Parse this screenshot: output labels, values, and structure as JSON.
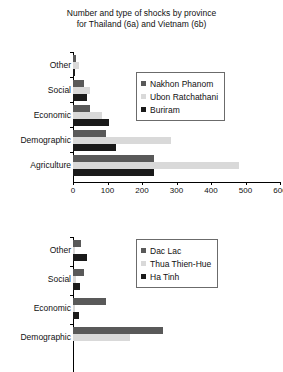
{
  "title": {
    "line1": "Number and type of shocks by province",
    "line2": "for Thailand (6a) and Vietnam (6b)"
  },
  "chart_data": [
    {
      "type": "bar",
      "orientation": "horizontal",
      "panel": "6a",
      "title": "Number and type of shocks by province for Thailand (6a)",
      "xlabel": "",
      "ylabel": "",
      "xlim": [
        0,
        600
      ],
      "xticks": [
        0,
        100,
        200,
        300,
        400,
        500,
        600
      ],
      "grid": false,
      "legend_position": "upper right",
      "categories": [
        "Other",
        "Social",
        "Economic",
        "Demographic",
        "Agriculture"
      ],
      "series": [
        {
          "name": "Nakhon Phanom",
          "color": "#595959",
          "values": [
            8,
            32,
            50,
            95,
            235
          ]
        },
        {
          "name": "Ubon Ratchathani",
          "color": "#d9d9d9",
          "values": [
            18,
            48,
            85,
            285,
            480
          ]
        },
        {
          "name": "Buriram",
          "color": "#1a1a1a",
          "values": [
            5,
            40,
            105,
            125,
            235
          ]
        }
      ]
    },
    {
      "type": "bar",
      "orientation": "horizontal",
      "panel": "6b",
      "title": "Number and type of shocks by province for Vietnam (6b)",
      "xlabel": "",
      "ylabel": "",
      "xlim": [
        0,
        600
      ],
      "xticks": [],
      "grid": false,
      "legend_position": "upper right",
      "note": "panel cropped at bottom of image; x-axis not visible",
      "categories": [
        "Other",
        "Social",
        "Economic",
        "Demographic"
      ],
      "series": [
        {
          "name": "Dac Lac",
          "color": "#595959",
          "values": [
            22,
            32,
            95,
            260
          ]
        },
        {
          "name": "Thua Thien-Hue",
          "color": "#d9d9d9",
          "values": [
            6,
            10,
            5,
            165
          ]
        },
        {
          "name": "Ha Tinh",
          "color": "#1a1a1a",
          "values": [
            42,
            20,
            18,
            0
          ]
        }
      ]
    }
  ],
  "chart_a": {
    "legend": [
      {
        "label": "Nakhon Phanom"
      },
      {
        "label": "Ubon Ratchathani"
      },
      {
        "label": "Buriram"
      }
    ],
    "categories": [
      {
        "label": "Other"
      },
      {
        "label": "Social"
      },
      {
        "label": "Economic"
      },
      {
        "label": "Demographic"
      },
      {
        "label": "Agriculture"
      }
    ],
    "xticks": [
      {
        "label": "0"
      },
      {
        "label": "100"
      },
      {
        "label": "200"
      },
      {
        "label": "300"
      },
      {
        "label": "400"
      },
      {
        "label": "500"
      },
      {
        "label": "600"
      }
    ]
  },
  "chart_b": {
    "legend": [
      {
        "label": "Dac Lac"
      },
      {
        "label": "Thua Thien-Hue"
      },
      {
        "label": "Ha Tinh"
      }
    ],
    "categories": [
      {
        "label": "Other"
      },
      {
        "label": "Social"
      },
      {
        "label": "Economic"
      },
      {
        "label": "Demographic"
      }
    ]
  }
}
